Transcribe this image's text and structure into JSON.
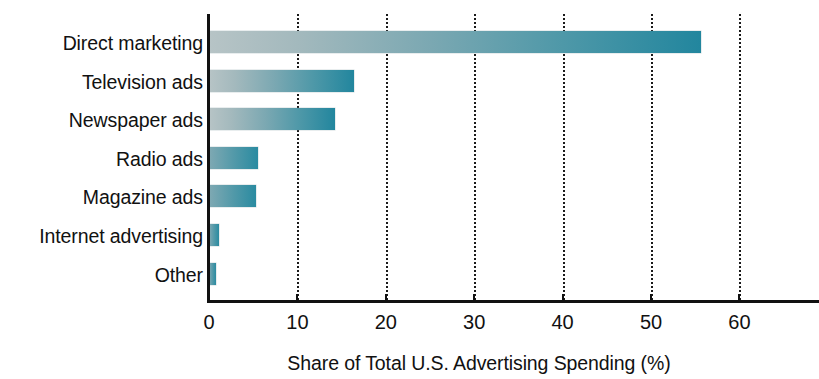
{
  "chart_data": {
    "type": "bar",
    "orientation": "horizontal",
    "title": "",
    "xlabel": "Share of Total U.S. Advertising Spending (%)",
    "ylabel": "",
    "categories": [
      "Direct marketing",
      "Television ads",
      "Newspaper ads",
      "Radio ads",
      "Magazine ads",
      "Internet advertising",
      "Other"
    ],
    "values": [
      55.6,
      16.4,
      14.3,
      5.5,
      5.3,
      1.1,
      0.8
    ],
    "xlim": [
      0,
      62
    ],
    "ylim": [
      0,
      7
    ],
    "xticks": [
      0,
      10,
      20,
      30,
      40,
      50,
      60
    ],
    "xtick_labels": [
      "0",
      "10",
      "20",
      "30",
      "40",
      "50",
      "60"
    ],
    "grid": "vertical-dotted",
    "legend": "none",
    "series": [
      {
        "name": "Share of Total U.S. Advertising Spending (%)",
        "values": [
          55.6,
          16.4,
          14.3,
          5.5,
          5.3,
          1.1,
          0.8
        ]
      }
    ],
    "colors": {
      "bar_gradient_start": "#b7c4c6",
      "bar_gradient_end": "#22869e",
      "axis": "#111111",
      "gridline": "#1a1a1a",
      "background": "#ffffff",
      "text": "#111111"
    }
  }
}
